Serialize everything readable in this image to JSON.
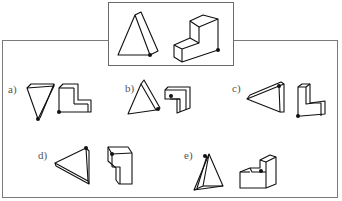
{
  "reference": {
    "shapes": [
      "triangular-prism",
      "l-shaped-block"
    ],
    "marked_vertex": "black dot"
  },
  "options": [
    {
      "label": "a)"
    },
    {
      "label": "b)"
    },
    {
      "label": "c)"
    },
    {
      "label": "d)"
    },
    {
      "label": "e)"
    }
  ],
  "colors": {
    "line": "#111111",
    "frame": "#7a7a7a",
    "label": "#555555",
    "background": "#ffffff"
  }
}
